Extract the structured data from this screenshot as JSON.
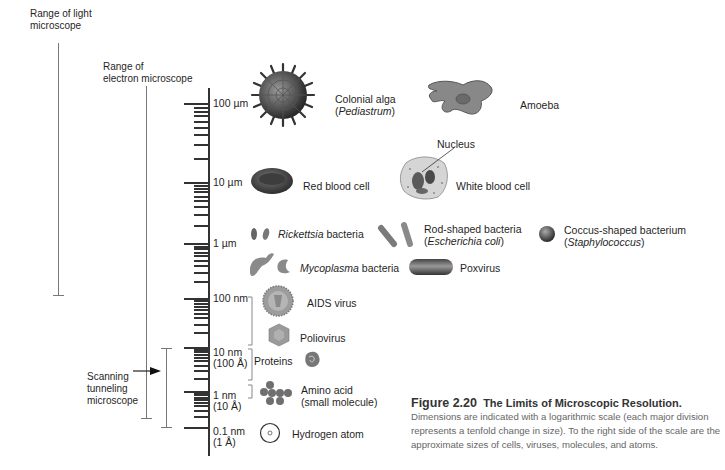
{
  "figure": {
    "number": "Figure 2.20",
    "title": "The Limits of Microscopic Resolution.",
    "description": "Dimensions are indicated with a logarithmic scale (each major division represents a tenfold change in size). To the right side of the scale are the approximate sizes of cells, viruses, molecules, and atoms."
  },
  "ranges": {
    "light": {
      "line1": "Range of light",
      "line2": "microscope"
    },
    "electron": {
      "line1": "Range of",
      "line2": "electron microscope"
    },
    "stm": {
      "line1": "Scanning",
      "line2": "tunneling",
      "line3": "microscope"
    }
  },
  "scale": {
    "major": [
      {
        "line1": "100 µm",
        "line2": ""
      },
      {
        "line1": "10 µm",
        "line2": ""
      },
      {
        "line1": "1 µm",
        "line2": ""
      },
      {
        "line1": "100 nm",
        "line2": ""
      },
      {
        "line1": "10 nm",
        "line2": "(100 Å)"
      },
      {
        "line1": "1 nm",
        "line2": "(10 Å)"
      },
      {
        "line1": "0.1 nm",
        "line2": "(1 Å)"
      }
    ]
  },
  "specimens": {
    "colonial_alga": {
      "line1": "Colonial alga",
      "line2": "Pediastrum"
    },
    "amoeba": {
      "label": "Amoeba"
    },
    "nucleus": {
      "label": "Nucleus"
    },
    "red_blood_cell": {
      "label": "Red blood cell"
    },
    "white_blood_cell": {
      "label": "White blood cell"
    },
    "rickettsia": {
      "italic": "Rickettsia",
      "rest": " bacteria"
    },
    "rod_shaped": {
      "line1": "Rod-shaped bacteria",
      "line2": "Escherichia coli"
    },
    "coccus": {
      "line1": "Coccus-shaped bacterium",
      "line2": "Staphylococcus"
    },
    "mycoplasma": {
      "italic": "Mycoplasma",
      "rest": " bacteria"
    },
    "poxvirus": {
      "label": "Poxvirus"
    },
    "aids_virus": {
      "label": "AIDS virus"
    },
    "poliovirus": {
      "label": "Poliovirus"
    },
    "proteins": {
      "label": "Proteins"
    },
    "amino_acid": {
      "line1": "Amino acid",
      "line2": "(small molecule)"
    },
    "hydrogen_atom": {
      "label": "Hydrogen atom"
    }
  }
}
